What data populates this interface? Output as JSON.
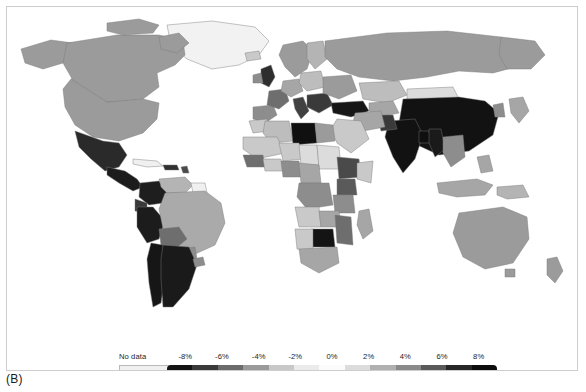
{
  "figure": {
    "panel_label": "(B)",
    "type": "choropleth-world-map"
  },
  "legend": {
    "no_data_label": "No data",
    "no_data_color": "#f0f0f0",
    "tick_labels": [
      "-8%",
      "-6%",
      "-4%",
      "-2%",
      "0%",
      "2%",
      "4%",
      "6%",
      "8%"
    ],
    "segment_colors": [
      "#141414",
      "#3a3a3a",
      "#6b6b6b",
      "#9a9a9a",
      "#c8c8c8",
      "#ebebeb",
      "#fcfcfc",
      "#dcdcdc",
      "#b0b0b0",
      "#8a8a8a",
      "#5a5a5a",
      "#272727",
      "#0d0d0d"
    ]
  },
  "chart_data": {
    "type": "heatmap",
    "title": "",
    "subtitle": "",
    "xlabel": "",
    "ylabel": "",
    "grid": false,
    "legend_position": "bottom",
    "colorbar": {
      "label": "",
      "units": "%",
      "vmin": -9,
      "vmax": 9,
      "tick_values": [
        -8,
        -6,
        -4,
        -2,
        0,
        2,
        4,
        6,
        8
      ],
      "tick_labels": [
        "-8%",
        "-6%",
        "-4%",
        "-2%",
        "0%",
        "2%",
        "4%",
        "6%",
        "8%"
      ],
      "diverging": true,
      "no_data_label": "No data"
    },
    "regions": [
      {
        "name": "Canada",
        "value": 3
      },
      {
        "name": "United States",
        "value": 3
      },
      {
        "name": "Greenland",
        "value": null
      },
      {
        "name": "Mexico",
        "value": 8
      },
      {
        "name": "Guatemala",
        "value": 8
      },
      {
        "name": "Honduras",
        "value": 8
      },
      {
        "name": "Nicaragua",
        "value": 8
      },
      {
        "name": "Costa Rica",
        "value": 8
      },
      {
        "name": "Panama",
        "value": 8
      },
      {
        "name": "Cuba",
        "value": null
      },
      {
        "name": "Haiti",
        "value": 7
      },
      {
        "name": "Dominican Republic",
        "value": 7
      },
      {
        "name": "Colombia",
        "value": 8
      },
      {
        "name": "Venezuela",
        "value": 3
      },
      {
        "name": "Guyana",
        "value": null
      },
      {
        "name": "Suriname",
        "value": null
      },
      {
        "name": "Ecuador",
        "value": 7
      },
      {
        "name": "Peru",
        "value": 8
      },
      {
        "name": "Brazil",
        "value": 3
      },
      {
        "name": "Bolivia",
        "value": 5
      },
      {
        "name": "Paraguay",
        "value": 4
      },
      {
        "name": "Chile",
        "value": 8
      },
      {
        "name": "Argentina",
        "value": 8
      },
      {
        "name": "Uruguay",
        "value": 4
      },
      {
        "name": "United Kingdom",
        "value": 7
      },
      {
        "name": "Ireland",
        "value": 4
      },
      {
        "name": "France",
        "value": 5
      },
      {
        "name": "Spain",
        "value": 4
      },
      {
        "name": "Portugal",
        "value": 3
      },
      {
        "name": "Germany",
        "value": 3
      },
      {
        "name": "Netherlands",
        "value": 4
      },
      {
        "name": "Belgium",
        "value": 4
      },
      {
        "name": "Switzerland",
        "value": 6
      },
      {
        "name": "Italy",
        "value": 6
      },
      {
        "name": "Austria",
        "value": 3
      },
      {
        "name": "Czechia",
        "value": 3
      },
      {
        "name": "Poland",
        "value": 2
      },
      {
        "name": "Norway",
        "value": 3
      },
      {
        "name": "Sweden",
        "value": 3
      },
      {
        "name": "Finland",
        "value": 2
      },
      {
        "name": "Denmark",
        "value": 5
      },
      {
        "name": "Estonia",
        "value": 2
      },
      {
        "name": "Latvia",
        "value": 2
      },
      {
        "name": "Lithuania",
        "value": 2
      },
      {
        "name": "Belarus",
        "value": 3
      },
      {
        "name": "Ukraine",
        "value": 3
      },
      {
        "name": "Romania",
        "value": 5
      },
      {
        "name": "Bulgaria",
        "value": 6
      },
      {
        "name": "Serbia",
        "value": 6
      },
      {
        "name": "Greece",
        "value": 7
      },
      {
        "name": "Hungary",
        "value": 3
      },
      {
        "name": "Turkey",
        "value": 8
      },
      {
        "name": "Russia",
        "value": 3
      },
      {
        "name": "Kazakhstan",
        "value": 2
      },
      {
        "name": "Mongolia",
        "value": 1
      },
      {
        "name": "China",
        "value": 9
      },
      {
        "name": "North Korea",
        "value": null
      },
      {
        "name": "South Korea",
        "value": 4
      },
      {
        "name": "Japan",
        "value": 3
      },
      {
        "name": "India",
        "value": 9
      },
      {
        "name": "Pakistan",
        "value": 7
      },
      {
        "name": "Afghanistan",
        "value": 3
      },
      {
        "name": "Iran",
        "value": 3
      },
      {
        "name": "Iraq",
        "value": 3
      },
      {
        "name": "Saudi Arabia",
        "value": 2
      },
      {
        "name": "Yemen",
        "value": 2
      },
      {
        "name": "Nepal",
        "value": 8
      },
      {
        "name": "Bangladesh",
        "value": 9
      },
      {
        "name": "Myanmar",
        "value": 8
      },
      {
        "name": "Thailand",
        "value": 4
      },
      {
        "name": "Vietnam",
        "value": 4
      },
      {
        "name": "Laos",
        "value": 4
      },
      {
        "name": "Cambodia",
        "value": 4
      },
      {
        "name": "Malaysia",
        "value": 3
      },
      {
        "name": "Indonesia",
        "value": 3
      },
      {
        "name": "Philippines",
        "value": 3
      },
      {
        "name": "Papua New Guinea",
        "value": 3
      },
      {
        "name": "Australia",
        "value": 3
      },
      {
        "name": "New Zealand",
        "value": 3
      },
      {
        "name": "Morocco",
        "value": 2
      },
      {
        "name": "Algeria",
        "value": 2
      },
      {
        "name": "Tunisia",
        "value": 2
      },
      {
        "name": "Libya",
        "value": 9
      },
      {
        "name": "Egypt",
        "value": 3
      },
      {
        "name": "Sudan",
        "value": 1
      },
      {
        "name": "Mauritania",
        "value": 2
      },
      {
        "name": "Mali",
        "value": 2
      },
      {
        "name": "Niger",
        "value": 2
      },
      {
        "name": "Chad",
        "value": 1
      },
      {
        "name": "Senegal",
        "value": 2
      },
      {
        "name": "Guinea",
        "value": 5
      },
      {
        "name": "Sierra Leone",
        "value": 5
      },
      {
        "name": "Liberia",
        "value": 5
      },
      {
        "name": "Ivory Coast",
        "value": 2
      },
      {
        "name": "Ghana",
        "value": 2
      },
      {
        "name": "Nigeria",
        "value": 4
      },
      {
        "name": "Cameroon",
        "value": 3
      },
      {
        "name": "Central African Republic",
        "value": 2
      },
      {
        "name": "Ethiopia",
        "value": 6
      },
      {
        "name": "Somalia",
        "value": 2
      },
      {
        "name": "Kenya",
        "value": 6
      },
      {
        "name": "Uganda",
        "value": 4
      },
      {
        "name": "Tanzania",
        "value": 4
      },
      {
        "name": "DR Congo",
        "value": 4
      },
      {
        "name": "Angola",
        "value": 2
      },
      {
        "name": "Zambia",
        "value": 4
      },
      {
        "name": "Zimbabwe",
        "value": 9
      },
      {
        "name": "Mozambique",
        "value": 5
      },
      {
        "name": "Botswana",
        "value": 1
      },
      {
        "name": "Namibia",
        "value": 2
      },
      {
        "name": "South Africa",
        "value": 3
      },
      {
        "name": "Madagascar",
        "value": 3
      }
    ]
  }
}
